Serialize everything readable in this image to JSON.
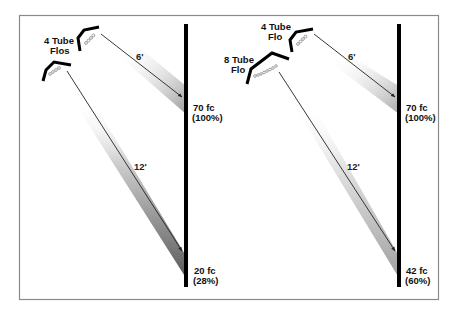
{
  "panels": [
    {
      "id": "left",
      "fixtures": [
        {
          "label_line1": "4 Tube",
          "label_line2": "Flos",
          "tubes": 4
        }
      ],
      "near": {
        "distance": "6'",
        "fc": "70 fc",
        "pct": "(100%)"
      },
      "far": {
        "distance": "12'",
        "fc": "20 fc",
        "pct": "(28%)"
      }
    },
    {
      "id": "right",
      "fixtures": [
        {
          "label_line1": "4 Tube",
          "label_line2": "Flo",
          "tubes": 4
        },
        {
          "label_line1": "8 Tube",
          "label_line2": "Flo",
          "tubes": 8
        }
      ],
      "near": {
        "distance": "6'",
        "fc": "70 fc",
        "pct": "(100%)"
      },
      "far": {
        "distance": "12'",
        "fc": "42 fc",
        "pct": "(60%)"
      }
    }
  ],
  "colors": {
    "border": "#8a8a8a",
    "wall": "#000000",
    "arrow": "#222222",
    "shadow_dark": "#555555",
    "shadow_light": "#b5b5b5"
  }
}
